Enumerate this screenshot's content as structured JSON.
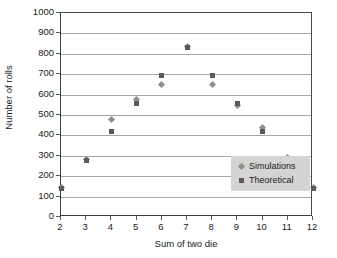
{
  "chart_data": {
    "type": "scatter",
    "title": "",
    "xlabel": "Sum of two die",
    "ylabel": "Number of rolls",
    "x": [
      2,
      3,
      4,
      5,
      6,
      7,
      8,
      9,
      10,
      11,
      12
    ],
    "xlim": [
      2,
      12
    ],
    "ylim": [
      0,
      1000
    ],
    "xticks": [
      "2",
      "3",
      "4",
      "5",
      "6",
      "7",
      "8",
      "9",
      "10",
      "11",
      "12"
    ],
    "yticks": [
      "0",
      "100",
      "200",
      "300",
      "400",
      "500",
      "600",
      "700",
      "800",
      "900",
      "1000"
    ],
    "ytick_values": [
      0,
      100,
      200,
      300,
      400,
      500,
      600,
      700,
      800,
      900,
      1000
    ],
    "grid": "horizontal",
    "legend_position": "inside-center",
    "series": [
      {
        "name": "Simulations",
        "marker": "diamond",
        "color": "#8e8e8e",
        "values": [
          145,
          280,
          480,
          575,
          650,
          835,
          650,
          545,
          440,
          290,
          145
        ]
      },
      {
        "name": "Theoretical",
        "marker": "square",
        "color": "#5a5a5a",
        "values": [
          139,
          278,
          417,
          556,
          694,
          833,
          694,
          556,
          417,
          278,
          139
        ]
      }
    ]
  },
  "legend": {
    "items": [
      {
        "label": "Simulations",
        "marker": "diamond"
      },
      {
        "label": "Theoretical",
        "marker": "square"
      }
    ]
  }
}
